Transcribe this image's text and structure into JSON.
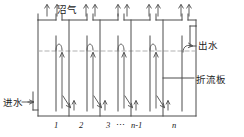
{
  "diagram": {
    "type": "anaerobic-baffled-reactor-schematic",
    "colors": {
      "line": "#4d4d4d",
      "dashed_water_line": "#a8a8a8",
      "text": "#1a1a1a",
      "background": "#ffffff"
    },
    "labels": {
      "biogas": "沼气",
      "effluent": "出水",
      "baffle_plate": "折流板",
      "influent": "进水"
    },
    "compartment_numbers": {
      "first": "1",
      "second": "2",
      "third": "3",
      "ellipsis": "⋯",
      "n_minus_1": "n-1",
      "n": "n"
    },
    "icons": {
      "gas_arrow": "arrow-up-icon",
      "inflow_arrow": "arrow-right-icon",
      "downflow_arrow": "arrow-down-icon",
      "upflow_arrow": "arrow-up-icon",
      "overflow_arrow": "curved-arrow-icon"
    }
  }
}
